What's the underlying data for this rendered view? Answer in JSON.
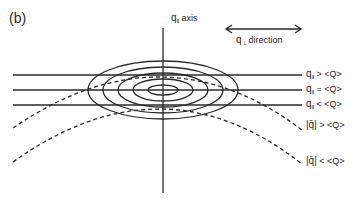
{
  "panel_label": "(b)",
  "axis": {
    "symbol": "q",
    "subscript": "II",
    "text": "axis"
  },
  "direction": {
    "symbol": "q",
    "subscript": "⊥",
    "text": "direction"
  },
  "right_labels": [
    {
      "symbol": "q",
      "subscript": "II",
      "relation": " > <Q>"
    },
    {
      "symbol": "q",
      "subscript": "II",
      "relation": " = <Q>"
    },
    {
      "symbol": "q",
      "subscript": "II",
      "relation": " < <Q>"
    },
    {
      "symbol": "|q̄|",
      "subscript": "",
      "relation": " > <Q>"
    },
    {
      "symbol": "|q̄|",
      "subscript": "",
      "relation": " < <Q>"
    }
  ],
  "colors": {
    "line": "#2a2a2a",
    "background": "#ffffff"
  },
  "geometry": {
    "center": [
      163,
      90
    ],
    "ellipses": [
      [
        15,
        5
      ],
      [
        30,
        11
      ],
      [
        45,
        17
      ],
      [
        60,
        23
      ],
      [
        75,
        28
      ]
    ],
    "horizontal_lines_y": [
      75,
      90,
      105
    ]
  }
}
